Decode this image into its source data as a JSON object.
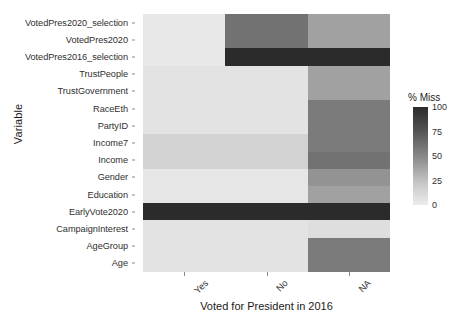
{
  "chart_data": {
    "type": "heatmap",
    "title": "",
    "xlabel": "Voted for President in 2016",
    "ylabel": "Variable",
    "legend_title": "% Miss",
    "legend_position": "right",
    "grid": false,
    "zlim": [
      0,
      100
    ],
    "legend_ticks": [
      100,
      75,
      50,
      25,
      0
    ],
    "colormap": "grayscale-dark-high",
    "colormap_stops": [
      "#2b2b2b",
      "#4f4f4f",
      "#8c8c8c",
      "#c8c8c8",
      "#ececec"
    ],
    "x": [
      "Yes",
      "No",
      "NA"
    ],
    "y": [
      "VotedPres2020_selection",
      "VotedPres2020",
      "VotedPres2016_selection",
      "TrustPeople",
      "TrustGovernment",
      "RaceEth",
      "PartyID",
      "Income7",
      "Income",
      "Gender",
      "Education",
      "EarlyVote2020",
      "CampaignInterest",
      "AgeGroup",
      "Age"
    ],
    "rows": [
      {
        "variable": "VotedPres2020_selection",
        "values": [
          3,
          62,
          42
        ]
      },
      {
        "variable": "VotedPres2020",
        "values": [
          3,
          62,
          42
        ]
      },
      {
        "variable": "VotedPres2016_selection",
        "values": [
          3,
          100,
          100
        ]
      },
      {
        "variable": "TrustPeople",
        "values": [
          6,
          6,
          42
        ]
      },
      {
        "variable": "TrustGovernment",
        "values": [
          6,
          6,
          42
        ]
      },
      {
        "variable": "RaceEth",
        "values": [
          6,
          6,
          58
        ]
      },
      {
        "variable": "PartyID",
        "values": [
          6,
          6,
          58
        ]
      },
      {
        "variable": "Income7",
        "values": [
          18,
          18,
          58
        ]
      },
      {
        "variable": "Income",
        "values": [
          18,
          18,
          62
        ]
      },
      {
        "variable": "Gender",
        "values": [
          4,
          4,
          48
        ]
      },
      {
        "variable": "Education",
        "values": [
          4,
          4,
          42
        ]
      },
      {
        "variable": "EarlyVote2020",
        "values": [
          100,
          100,
          100
        ]
      },
      {
        "variable": "CampaignInterest",
        "values": [
          6,
          6,
          10
        ]
      },
      {
        "variable": "AgeGroup",
        "values": [
          6,
          6,
          58
        ]
      },
      {
        "variable": "Age",
        "values": [
          6,
          6,
          58
        ]
      }
    ]
  }
}
